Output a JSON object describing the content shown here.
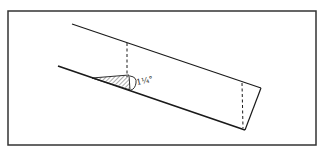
{
  "figure": {
    "type": "technical-sketch",
    "angle_label": "1¼°"
  },
  "colors": {
    "ink": "#1a1a1a",
    "frame": "#333333",
    "hatch": "#555555",
    "background": "#ffffff"
  }
}
